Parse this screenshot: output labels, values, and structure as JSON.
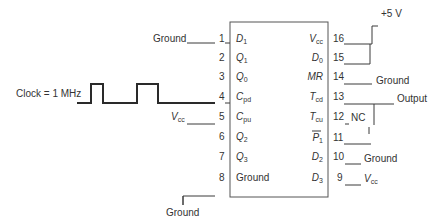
{
  "diagram": {
    "type": "circuit-pinout",
    "chip": {
      "left_pins": [
        {
          "num": "1",
          "name": "D",
          "sub": "1",
          "connection": "Ground"
        },
        {
          "num": "2",
          "name": "Q",
          "sub": "1",
          "connection": ""
        },
        {
          "num": "3",
          "name": "Q",
          "sub": "0",
          "connection": ""
        },
        {
          "num": "4",
          "name": "C",
          "sub": "pd",
          "connection": "Clock = 1 MHz"
        },
        {
          "num": "5",
          "name": "C",
          "sub": "pu",
          "connection": "Vcc"
        },
        {
          "num": "6",
          "name": "Q",
          "sub": "2",
          "connection": ""
        },
        {
          "num": "7",
          "name": "Q",
          "sub": "3",
          "connection": ""
        },
        {
          "num": "8",
          "name": "Ground",
          "sub": "",
          "connection": "Ground"
        }
      ],
      "right_pins": [
        {
          "num": "16",
          "name": "V",
          "sub": "cc",
          "connection": "+5 V"
        },
        {
          "num": "15",
          "name": "D",
          "sub": "0",
          "connection": "+5 V"
        },
        {
          "num": "14",
          "name": "MR",
          "sub": "",
          "connection": "Ground"
        },
        {
          "num": "13",
          "name": "T",
          "sub": "cd",
          "connection": "Output"
        },
        {
          "num": "12",
          "name": "T",
          "sub": "cu",
          "connection": "NC"
        },
        {
          "num": "11",
          "name": "P",
          "sub": "1",
          "overbar": true,
          "connection": "Output"
        },
        {
          "num": "10",
          "name": "D",
          "sub": "2",
          "connection": "Ground"
        },
        {
          "num": "9",
          "name": "D",
          "sub": "3",
          "connection": "Vcc"
        }
      ]
    },
    "labels": {
      "clock": "Clock = 1 MHz",
      "ground_pin1": "Ground",
      "vcc_pin5": "V",
      "vcc_pin5_sub": "cc",
      "ground_pin8": "Ground",
      "plus5v": "+5 V",
      "ground_pin14": "Ground",
      "output": "Output",
      "nc": "NC",
      "ground_pin10": "Ground",
      "vcc_pin9": "V",
      "vcc_pin9_sub": "cc"
    }
  }
}
